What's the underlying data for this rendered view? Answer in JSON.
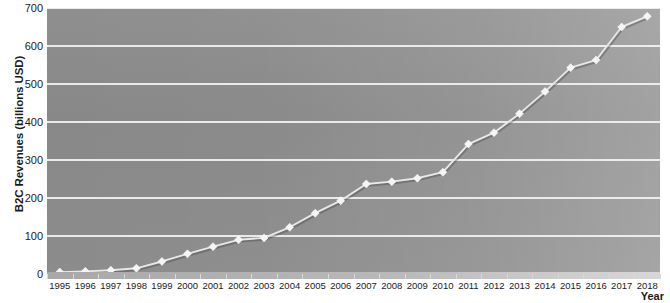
{
  "chart_data": {
    "type": "line",
    "title": "",
    "xlabel": "Year",
    "ylabel": "B2C Revenues (billions USD)",
    "x": [
      1995,
      1996,
      1997,
      1998,
      1999,
      2000,
      2001,
      2002,
      2003,
      2004,
      2005,
      2006,
      2007,
      2008,
      2009,
      2010,
      2011,
      2012,
      2013,
      2014,
      2015,
      2016,
      2017,
      2018
    ],
    "categories": [
      "1995",
      "1996",
      "1997",
      "1998",
      "1999",
      "2000",
      "2001",
      "2002",
      "2003",
      "2004",
      "2005",
      "2006",
      "2007",
      "2008",
      "2009",
      "2010",
      "2011",
      "2012",
      "2013",
      "2014",
      "2015",
      "2016",
      "2017",
      "2018"
    ],
    "values": [
      5,
      7,
      10,
      15,
      33,
      53,
      72,
      90,
      95,
      123,
      160,
      193,
      237,
      243,
      252,
      268,
      342,
      372,
      422,
      480,
      543,
      563,
      650,
      678
    ],
    "series": [
      {
        "name": "B2C Revenues",
        "values": [
          5,
          7,
          10,
          15,
          33,
          53,
          72,
          90,
          95,
          123,
          160,
          193,
          237,
          243,
          252,
          268,
          342,
          372,
          422,
          480,
          543,
          563,
          650,
          678
        ]
      }
    ],
    "ylim": [
      0,
      700
    ],
    "yticks": [
      0,
      100,
      200,
      300,
      400,
      500,
      600,
      700
    ],
    "ytick_labels": [
      "0",
      "100",
      "200",
      "300",
      "400",
      "500",
      "600",
      "700"
    ],
    "xlim": [
      1995,
      2018
    ],
    "grid": "horizontal",
    "legend": "none",
    "marker": "diamond",
    "colors": {
      "plot_background_dark": "#8a8a8a",
      "plot_background_light": "#b0b0b0",
      "gridline": "#f2f2f2",
      "line": "#e8e8e8",
      "marker": "#f5f5f5",
      "text": "#1a1a1a",
      "page_background": "#ffffff"
    }
  }
}
